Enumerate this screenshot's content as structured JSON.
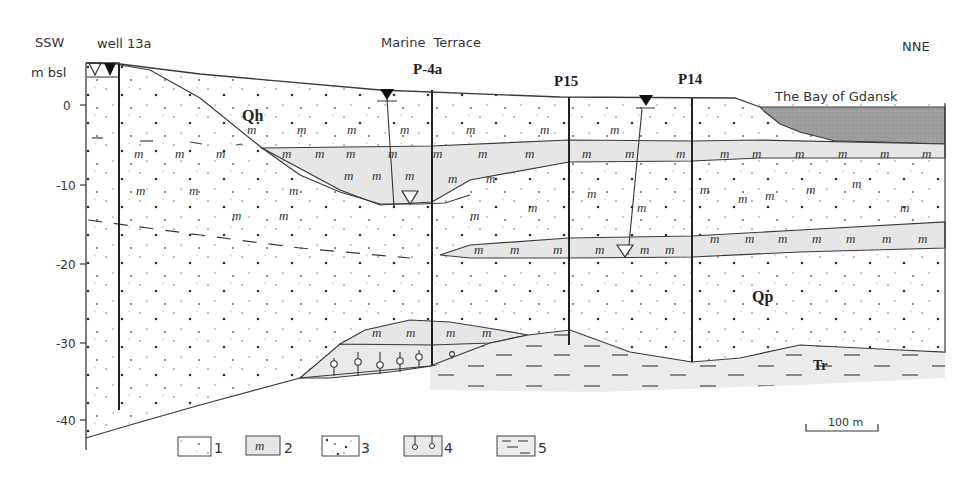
{
  "figure": {
    "direction_left": "SSW",
    "direction_right": "NNE",
    "y_axis_unit": "m bsl",
    "y_ticks": [
      {
        "label": "0",
        "y": 105
      },
      {
        "label": "-10",
        "y": 185
      },
      {
        "label": "-20",
        "y": 264
      },
      {
        "label": "-30",
        "y": 343
      },
      {
        "label": "-40",
        "y": 420
      }
    ],
    "region_label": "Marine  Terrace",
    "sea_label": "The Bay of Gdansk",
    "wells": [
      {
        "name": "well 13a",
        "x": 119,
        "top": 64,
        "bottom": 410
      },
      {
        "name": "P-4a",
        "x": 432,
        "top": 90,
        "bottom": 365
      },
      {
        "name": "P15",
        "x": 569,
        "top": 97,
        "bottom": 345
      },
      {
        "name": "P14",
        "x": 692,
        "top": 98,
        "bottom": 362
      }
    ],
    "unit_labels": {
      "qh": "Qh",
      "qp": "Qp",
      "tr": "Tr"
    },
    "scale_bar": {
      "label": "100 m"
    },
    "legend": [
      {
        "id": "1",
        "label": "1",
        "description": "fine sand"
      },
      {
        "id": "2",
        "label": "2",
        "description": "organic / peat-silt layer"
      },
      {
        "id": "3",
        "label": "3",
        "description": "coarse sand with gravel"
      },
      {
        "id": "4",
        "label": "4",
        "description": "till / boulder clay"
      },
      {
        "id": "5",
        "label": "5",
        "description": "clay"
      }
    ],
    "colors": {
      "line": "#3a3a3a",
      "layer_gray": "#e6e6e6",
      "sea_gray": "#9e9e9e",
      "clay_gray": "#ececec",
      "background": "#ffffff"
    },
    "symbols": {
      "organic": "m",
      "water_table_filled": "▼",
      "water_table_open": "▽"
    }
  }
}
